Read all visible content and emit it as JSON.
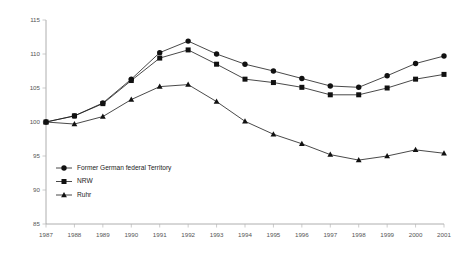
{
  "chart_data": {
    "type": "line",
    "title": "",
    "subtitle": "",
    "xlabel": "",
    "ylabel": "",
    "x": [
      1987,
      1988,
      1989,
      1990,
      1991,
      1992,
      1993,
      1994,
      1995,
      1996,
      1997,
      1998,
      1999,
      2000,
      2001
    ],
    "categories": [
      "1987",
      "1988",
      "1989",
      "1990",
      "1991",
      "1992",
      "1993",
      "1994",
      "1995",
      "1996",
      "1997",
      "1998",
      "1999",
      "2000",
      "2001"
    ],
    "xtick_labels": [
      "1987",
      "1988",
      "1989",
      "1990",
      "1991",
      "1992",
      "1993",
      "1994",
      "1995",
      "1996",
      "1997",
      "1998",
      "1999",
      "2000",
      "2001"
    ],
    "ytick_labels": [
      "85",
      "90",
      "95",
      "100",
      "105",
      "110",
      "115"
    ],
    "yticks": [
      85,
      90,
      95,
      100,
      105,
      110,
      115
    ],
    "ylim": [
      85,
      115
    ],
    "xlim": [
      1987,
      2001
    ],
    "grid": false,
    "legend_position": "inside-lower-left",
    "series": [
      {
        "name": "Former German federal Territory",
        "marker": "circle",
        "color": "#111111",
        "values": [
          100.0,
          100.9,
          102.8,
          106.3,
          110.2,
          111.9,
          110.0,
          108.5,
          107.5,
          106.4,
          105.3,
          105.1,
          106.8,
          108.6,
          109.7
        ]
      },
      {
        "name": "NRW",
        "marker": "square",
        "color": "#111111",
        "values": [
          100.0,
          100.9,
          102.7,
          106.1,
          109.4,
          110.6,
          108.5,
          106.3,
          105.8,
          105.1,
          104.0,
          104.0,
          105.0,
          106.3,
          107.0
        ]
      },
      {
        "name": "Ruhr",
        "marker": "triangle",
        "color": "#111111",
        "values": [
          100.0,
          99.7,
          100.8,
          103.3,
          105.2,
          105.5,
          103.0,
          100.1,
          98.2,
          96.8,
          95.2,
          94.4,
          95.0,
          95.9,
          95.4
        ]
      }
    ],
    "legend": [
      {
        "label": "Former German federal Territory",
        "marker": "circle"
      },
      {
        "label": "NRW",
        "marker": "square"
      },
      {
        "label": "Ruhr",
        "marker": "triangle"
      }
    ]
  },
  "colors": {
    "series": "#111111",
    "axis": "#9a9a9a",
    "tick_text": "#555555",
    "legend_text": "#222222",
    "background": "#ffffff"
  }
}
